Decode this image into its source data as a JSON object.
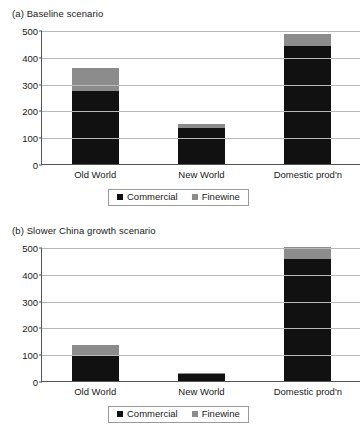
{
  "figure": {
    "legend": {
      "commercial_label": "Commercial",
      "finewine_label": "Finewine",
      "commercial_color": "#111111",
      "finewine_color": "#8c8c8c"
    },
    "yticks": [
      "500",
      "400",
      "300",
      "200",
      "100",
      "0"
    ]
  },
  "chart_data": [
    {
      "type": "bar",
      "title": "(a) Baseline scenario",
      "stacked": true,
      "categories": [
        "Old World",
        "New World",
        "Domestic prod'n"
      ],
      "series": [
        {
          "name": "Commercial",
          "values": [
            273,
            133,
            440
          ],
          "color": "#111111"
        },
        {
          "name": "Finewine",
          "values": [
            85,
            15,
            45
          ],
          "color": "#8c8c8c"
        }
      ],
      "totals": [
        358,
        148,
        485
      ],
      "xlabel": "",
      "ylabel": "",
      "ylim": [
        0,
        500
      ],
      "ytick_step": 100,
      "grid": true,
      "legend_position": "bottom"
    },
    {
      "type": "bar",
      "title": "(b) Slower China growth scenario",
      "stacked": true,
      "categories": [
        "Old World",
        "New World",
        "Domestic prod'n"
      ],
      "series": [
        {
          "name": "Commercial",
          "values": [
            97,
            27,
            456
          ],
          "color": "#111111"
        },
        {
          "name": "Finewine",
          "values": [
            36,
            2,
            44
          ],
          "color": "#8c8c8c"
        }
      ],
      "totals": [
        133,
        29,
        500
      ],
      "xlabel": "",
      "ylabel": "",
      "ylim": [
        0,
        500
      ],
      "ytick_step": 100,
      "grid": true,
      "legend_position": "bottom"
    }
  ]
}
